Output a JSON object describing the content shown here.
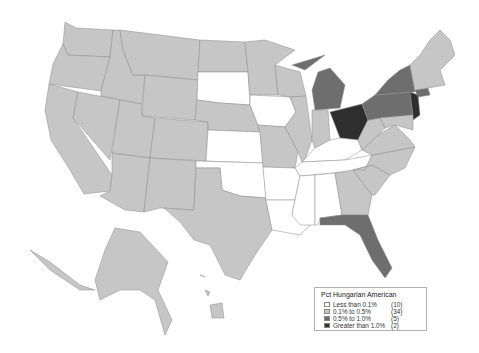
{
  "legend": {
    "title": "Pct Hungarian American",
    "items": [
      {
        "label": "Less than 0.1%",
        "count": "(10)",
        "color": "#ffffff"
      },
      {
        "label": "0.1% to 0.5%",
        "count": "(34)",
        "color": "#c6c6c6"
      },
      {
        "label": "0.5% to 1.0%",
        "count": "(5)",
        "color": "#6e6e6e"
      },
      {
        "label": "Greater than 1.0%",
        "count": "(2)",
        "color": "#2e2e2e"
      }
    ]
  },
  "states": {
    "less_than_0_1": [
      "South Dakota",
      "Iowa",
      "Kansas",
      "Oklahoma",
      "Arkansas",
      "Louisiana",
      "Mississippi",
      "Alabama",
      "Kentucky",
      "Tennessee"
    ],
    "0_5_to_1_0": [
      "Michigan",
      "New York",
      "Pennsylvania",
      "Connecticut",
      "Florida"
    ],
    "greater_than_1_0": [
      "Ohio",
      "New Jersey"
    ]
  }
}
